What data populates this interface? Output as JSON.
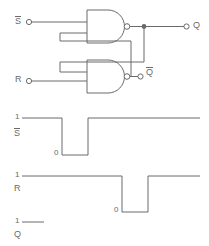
{
  "figure": {
    "stroke_color": "#6a6a6a",
    "background_color": "#ffffff",
    "line_width": 1
  },
  "circuit": {
    "inputs": [
      {
        "name": "s-bar-input",
        "label": "S",
        "overbar": true,
        "terminal": "open-circle",
        "x": 18,
        "y": 22
      },
      {
        "name": "r-bar-input",
        "label": "R",
        "overbar": true,
        "terminal": "open-circle",
        "x": 18,
        "y": 81
      }
    ],
    "gates": [
      {
        "name": "nand-gate-top",
        "type": "NAND",
        "inputs": 2,
        "output": "Q"
      },
      {
        "name": "nand-gate-bottom",
        "type": "NAND",
        "inputs": 2,
        "output": "Qbar"
      }
    ],
    "outputs": [
      {
        "name": "q-output",
        "label": "Q",
        "overbar": false,
        "terminal": "open-circle",
        "x": 188,
        "y": 27
      },
      {
        "name": "qbar-output",
        "label": "Q",
        "overbar": true,
        "terminal": "open-circle",
        "x": 142,
        "y": 74
      }
    ],
    "nodes": [
      {
        "name": "q-junction-dot",
        "type": "junction",
        "x": 144,
        "y": 27
      }
    ]
  },
  "waveforms": {
    "xlabel": "",
    "levels": {
      "high": "1",
      "low": "0"
    },
    "traces": [
      {
        "name": "s-bar-waveform",
        "label": "S",
        "overbar": true,
        "high_label": "1",
        "low_label": "0",
        "description": "Active-low pulse: high, drops low, returns high",
        "points": [
          {
            "t": 0,
            "v": 1
          },
          {
            "t": 0.33,
            "v": 1
          },
          {
            "t": 0.33,
            "v": 0
          },
          {
            "t": 0.66,
            "v": 0
          },
          {
            "t": 0.66,
            "v": 1
          },
          {
            "t": 1.0,
            "v": 1
          }
        ]
      },
      {
        "name": "r-bar-waveform",
        "label": "R",
        "overbar": true,
        "high_label": "1",
        "low_label": "0",
        "description": "Active-low pulse later in time: high, drops low, returns high",
        "points": [
          {
            "t": 0,
            "v": 1
          },
          {
            "t": 0.66,
            "v": 1
          },
          {
            "t": 0.66,
            "v": 0
          },
          {
            "t": 0.86,
            "v": 0
          },
          {
            "t": 0.86,
            "v": 1
          },
          {
            "t": 1.0,
            "v": 1
          }
        ]
      },
      {
        "name": "q-waveform",
        "label": "Q",
        "overbar": false,
        "high_label": "1",
        "low_label": "",
        "description": "Output trace, only initial high segment drawn",
        "points": [
          {
            "t": 0,
            "v": 1
          },
          {
            "t": 0.14,
            "v": 1
          }
        ]
      }
    ]
  }
}
